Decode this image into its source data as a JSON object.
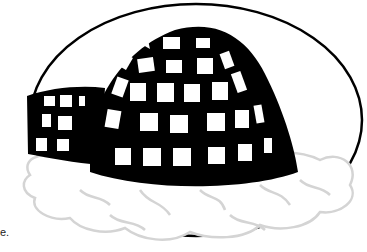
{
  "image": {
    "subject": "igloo illustration",
    "description": "Black and white drawing of an igloo with a grid of ice blocks, a small entrance tunnel on the left, sitting on a cloud of snow, surrounded by an oval outline",
    "caption_fragment": "e."
  },
  "colors": {
    "ink": "#000000",
    "background": "#ffffff",
    "snow_shade": "#d8d8d8"
  }
}
